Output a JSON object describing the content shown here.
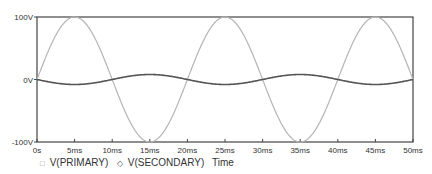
{
  "chart_data": {
    "type": "line",
    "title": "",
    "xlabel": "Time",
    "ylabel": "",
    "xlim": [
      0,
      50
    ],
    "ylim": [
      -100,
      100
    ],
    "x_unit": "ms",
    "y_unit": "V",
    "grid": false,
    "legend_position": "bottom-left",
    "x_ticks": [
      "0s",
      "5ms",
      "10ms",
      "15ms",
      "20ms",
      "25ms",
      "30ms",
      "35ms",
      "40ms",
      "45ms",
      "50ms"
    ],
    "y_ticks": [
      "100V",
      "0V",
      "-100V"
    ],
    "x": [
      0,
      2.5,
      5,
      7.5,
      10,
      12.5,
      15,
      17.5,
      20,
      22.5,
      25,
      27.5,
      30,
      32.5,
      35,
      37.5,
      40,
      42.5,
      45,
      47.5,
      50
    ],
    "series": [
      {
        "name": "V(PRIMARY)",
        "marker": "square",
        "color": "#b4b4b4",
        "description": "100V amplitude sine, 50Hz",
        "amplitude": 100,
        "period_ms": 20,
        "values": [
          0,
          70.7,
          100,
          70.7,
          0,
          -70.7,
          -100,
          -70.7,
          0,
          70.7,
          100,
          70.7,
          0,
          -70.7,
          -100,
          -70.7,
          0,
          70.7,
          100,
          70.7,
          0
        ]
      },
      {
        "name": "V(SECONDARY)",
        "marker": "diamond",
        "color": "#555555",
        "description": "~8V amplitude inverted sine, 50Hz",
        "amplitude": -8,
        "period_ms": 20,
        "values": [
          0,
          -5.7,
          -8,
          -5.7,
          0,
          5.7,
          8,
          5.7,
          0,
          -5.7,
          -8,
          -5.7,
          0,
          5.7,
          8,
          5.7,
          0,
          -5.7,
          -8,
          -5.7,
          0
        ]
      }
    ]
  },
  "legend": {
    "items": [
      {
        "symbol": "□",
        "label": "V(PRIMARY)"
      },
      {
        "symbol": "◇",
        "label": "V(SECONDARY)"
      }
    ],
    "xlabel": "Time"
  },
  "colors": {
    "axis": "#444444",
    "primary": "#b4b4b4",
    "secondary": "#555555",
    "text": "#333333"
  }
}
